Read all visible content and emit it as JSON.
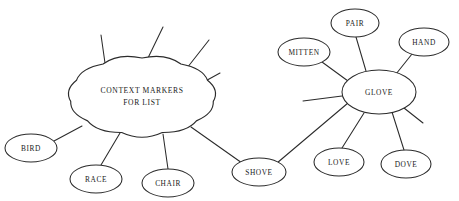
{
  "diagram": {
    "type": "semantic-web-concept-map",
    "title_note": "",
    "background_color": "#ffffff",
    "stroke_color": "#2b2b2b",
    "text_color": "#1a1a1a",
    "canvas": {
      "width": 459,
      "height": 201
    }
  },
  "central_cloud": {
    "label_line1": "CONTEXT MARKERS",
    "label_line2": "FOR LIST",
    "shape": "cloud",
    "cx": 142,
    "cy": 96,
    "rx": 72,
    "ry": 38
  },
  "hub": {
    "label": "GLOVE",
    "shape": "ellipse",
    "cx": 379,
    "cy": 92,
    "rx": 37,
    "ry": 22
  },
  "nodes": [
    {
      "id": "bird",
      "label": "BIRD",
      "cx": 31,
      "cy": 148,
      "rx": 26,
      "ry": 14,
      "cluster": "cloud"
    },
    {
      "id": "race",
      "label": "RACE",
      "cx": 96,
      "cy": 179,
      "rx": 26,
      "ry": 14,
      "cluster": "cloud"
    },
    {
      "id": "chair",
      "label": "CHAIR",
      "cx": 168,
      "cy": 183,
      "rx": 26,
      "ry": 14,
      "cluster": "cloud"
    },
    {
      "id": "shove",
      "label": "SHOVE",
      "cx": 259,
      "cy": 172,
      "rx": 27,
      "ry": 14,
      "cluster": "bridge"
    },
    {
      "id": "mitten",
      "label": "MITTEN",
      "cx": 304,
      "cy": 52,
      "rx": 26,
      "ry": 14,
      "cluster": "glove"
    },
    {
      "id": "pair",
      "label": "PAIR",
      "cx": 355,
      "cy": 23,
      "rx": 24,
      "ry": 14,
      "cluster": "glove"
    },
    {
      "id": "hand",
      "label": "HAND",
      "cx": 424,
      "cy": 42,
      "rx": 25,
      "ry": 14,
      "cluster": "glove"
    },
    {
      "id": "love",
      "label": "LOVE",
      "cx": 339,
      "cy": 162,
      "rx": 25,
      "ry": 14,
      "cluster": "glove"
    },
    {
      "id": "dove",
      "label": "DOVE",
      "cx": 406,
      "cy": 164,
      "rx": 25,
      "ry": 14,
      "cluster": "glove"
    }
  ],
  "edges": [
    {
      "from": "cloud",
      "to": "bird",
      "x1": 82,
      "y1": 126,
      "x2": 54,
      "y2": 141
    },
    {
      "from": "cloud",
      "to": "race",
      "x1": 120,
      "y1": 133,
      "x2": 101,
      "y2": 165
    },
    {
      "from": "cloud",
      "to": "chair",
      "x1": 163,
      "y1": 134,
      "x2": 168,
      "y2": 169
    },
    {
      "from": "cloud",
      "to": "shove",
      "x1": 191,
      "y1": 127,
      "x2": 242,
      "y2": 163
    },
    {
      "from": "shove",
      "to": "glove",
      "x1": 277,
      "y1": 163,
      "x2": 348,
      "y2": 103
    },
    {
      "from": "glove",
      "to": "mitten",
      "x1": 348,
      "y1": 81,
      "x2": 322,
      "y2": 62
    },
    {
      "from": "glove",
      "to": "pair",
      "x1": 366,
      "y1": 71,
      "x2": 356,
      "y2": 37
    },
    {
      "from": "glove",
      "to": "hand",
      "x1": 396,
      "y1": 74,
      "x2": 412,
      "y2": 54
    },
    {
      "from": "glove",
      "to": "love",
      "x1": 364,
      "y1": 113,
      "x2": 342,
      "y2": 148
    },
    {
      "from": "glove",
      "to": "dove",
      "x1": 392,
      "y1": 112,
      "x2": 404,
      "y2": 150
    }
  ],
  "free_stubs": [
    {
      "owner": "cloud",
      "x1": 105,
      "y1": 63,
      "x2": 101,
      "y2": 35
    },
    {
      "owner": "cloud",
      "x1": 147,
      "y1": 60,
      "x2": 163,
      "y2": 27
    },
    {
      "owner": "cloud",
      "x1": 187,
      "y1": 68,
      "x2": 209,
      "y2": 40
    },
    {
      "owner": "cloud",
      "x1": 200,
      "y1": 84,
      "x2": 220,
      "y2": 73
    },
    {
      "owner": "glove",
      "x1": 342,
      "y1": 96,
      "x2": 303,
      "y2": 101
    },
    {
      "owner": "glove",
      "x1": 404,
      "y1": 108,
      "x2": 423,
      "y2": 123
    }
  ]
}
